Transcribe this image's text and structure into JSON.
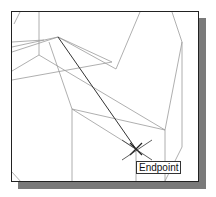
{
  "viewport": {
    "snap_tooltip": "Endpoint",
    "snap_marker": "endpoint-snap-marker",
    "colors": {
      "geometry": "#9a9a9a",
      "active_line": "#333333",
      "background": "#ffffff"
    }
  }
}
